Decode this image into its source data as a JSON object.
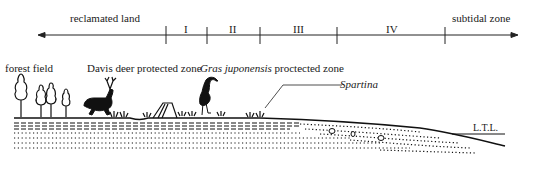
{
  "axis": {
    "left_label": "reclamated land",
    "right_label": "subtidal zone",
    "zones": [
      "I",
      "II",
      "III",
      "IV"
    ]
  },
  "labels": {
    "forest": "forest field",
    "deer": "Davis deer protected zone",
    "crane_italic": "Gras juponensis",
    "crane_rest": " proctected zone",
    "spartina": "Spartina",
    "ltl": "L.T.L."
  },
  "colors": {
    "ink": "#111111",
    "background": "#ffffff"
  }
}
